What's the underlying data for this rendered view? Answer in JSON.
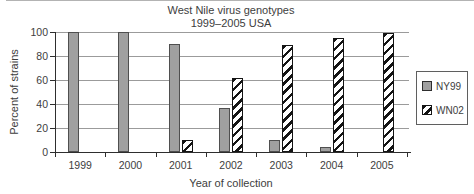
{
  "figure": {
    "title_line1": "West Nile virus genotypes",
    "title_line2": "1999–2005 USA",
    "x_axis_label": "Year of collection",
    "y_axis_label": "Percent of strains"
  },
  "chart_data": {
    "type": "bar",
    "title": "West Nile virus genotypes 1999–2005 USA",
    "categories": [
      "1999",
      "2000",
      "2001",
      "2002",
      "2003",
      "2004",
      "2005"
    ],
    "series": [
      {
        "name": "NY99",
        "pattern": "solid-gray",
        "fill": "#a0a0a0",
        "border": "#4f4f4f",
        "values": [
          100,
          100,
          90,
          37,
          10,
          4,
          0
        ]
      },
      {
        "name": "WN02",
        "pattern": "diagonal-hatch",
        "fill": "#ffffff",
        "border": "#141414",
        "values": [
          0,
          0,
          10,
          62,
          89,
          95,
          99
        ]
      }
    ],
    "xlabel": "Year of collection",
    "ylabel": "Percent of strains",
    "ylim": [
      0,
      100
    ],
    "yticks": [
      0,
      20,
      40,
      60,
      80,
      100
    ],
    "grid": true,
    "legend_position": "right-outside",
    "axis_color": "#2e2e2e",
    "gridline_color": "#9b9b9b",
    "text_color": "#3d3d3d"
  }
}
